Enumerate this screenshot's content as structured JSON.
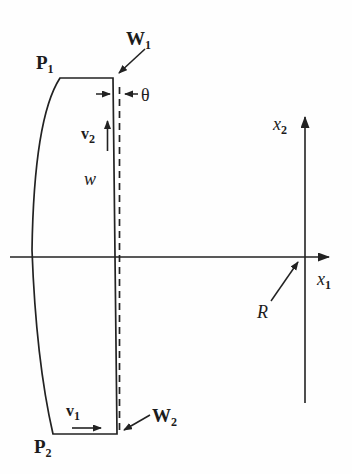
{
  "figure": {
    "background": "#fefefe",
    "ink_color": "#222222",
    "labels": {
      "P1": {
        "base": "P",
        "sub": "1"
      },
      "P2": {
        "base": "P",
        "sub": "2"
      },
      "W1": {
        "base": "W",
        "sub": "1"
      },
      "W2": {
        "base": "W",
        "sub": "2"
      },
      "v1": {
        "base": "v",
        "sub": "1"
      },
      "v2": {
        "base": "v",
        "sub": "2"
      },
      "w": {
        "text": "w"
      },
      "theta": {
        "text": "θ"
      },
      "R": {
        "text": "R"
      },
      "x1": {
        "base": "x",
        "sub": "1"
      },
      "x2": {
        "base": "x",
        "sub": "2"
      }
    }
  }
}
